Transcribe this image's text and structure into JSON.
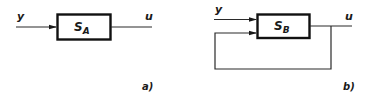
{
  "diagrams": [
    {
      "id": "a",
      "caption": "a)",
      "block": {
        "label_main": "S",
        "label_sub": "A"
      },
      "input_label": "y",
      "output_label": "u",
      "feedback": false
    },
    {
      "id": "b",
      "caption": "b)",
      "block": {
        "label_main": "S",
        "label_sub": "B"
      },
      "input_label": "y",
      "output_label": "u",
      "feedback": true
    }
  ],
  "colors": {
    "stroke": "#2a2a2a",
    "box_border": "#111111",
    "background": "#ffffff"
  }
}
